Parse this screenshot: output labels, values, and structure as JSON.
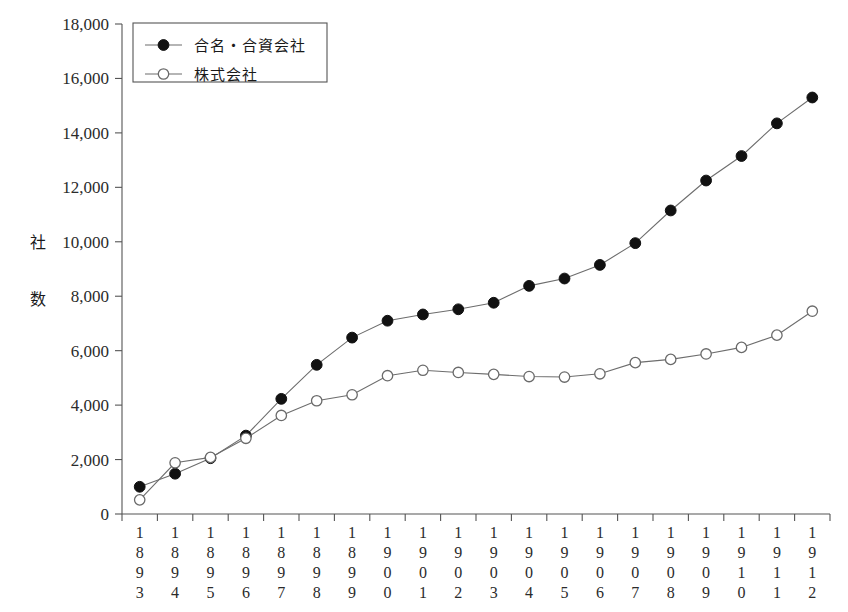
{
  "chart_data": {
    "type": "line",
    "title": "",
    "xlabel": "",
    "ylabel": "社数",
    "ylabel_chars": [
      "社",
      "数"
    ],
    "ylim": [
      0,
      18000
    ],
    "ytick_step": 2000,
    "grid": false,
    "legend_position": "top-left",
    "ytick_labels": [
      "18,000",
      "16,000",
      "14,000",
      "12,000",
      "10,000",
      "8,000",
      "6,000",
      "4,000",
      "2,000",
      "0"
    ],
    "ytick_values": [
      18000,
      16000,
      14000,
      12000,
      10000,
      8000,
      6000,
      4000,
      2000,
      0
    ],
    "categories": [
      "1893",
      "1894",
      "1895",
      "1896",
      "1897",
      "1898",
      "1899",
      "1900",
      "1901",
      "1902",
      "1903",
      "1904",
      "1905",
      "1906",
      "1907",
      "1908",
      "1909",
      "1910",
      "1911",
      "1912"
    ],
    "series": [
      {
        "name": "合名・合資会社",
        "marker": "filled-circle",
        "values": [
          1000,
          1480,
          2050,
          2880,
          4230,
          5480,
          6480,
          7100,
          7330,
          7520,
          7760,
          8380,
          8650,
          9150,
          9950,
          11150,
          12250,
          13150,
          14350,
          15300
        ]
      },
      {
        "name": "株式会社",
        "marker": "open-circle",
        "values": [
          520,
          1880,
          2080,
          2780,
          3620,
          4160,
          4380,
          5080,
          5280,
          5200,
          5130,
          5050,
          5030,
          5150,
          5560,
          5680,
          5880,
          6120,
          6570,
          7450
        ]
      }
    ]
  },
  "legend": {
    "entries": [
      {
        "label": "合名・合資会社",
        "marker": "filled-circle"
      },
      {
        "label": "株式会社",
        "marker": "open-circle"
      }
    ]
  },
  "axes": {
    "y_axis_name": "y-axis",
    "x_axis_name": "x-axis"
  }
}
